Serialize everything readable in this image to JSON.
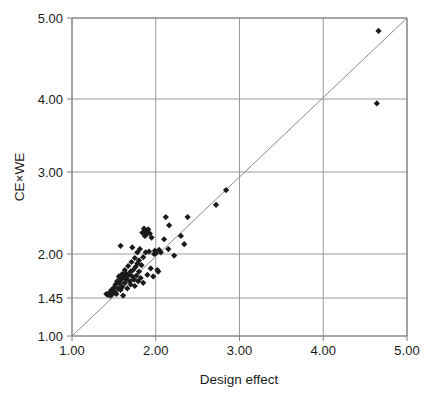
{
  "chart_data": {
    "type": "scatter",
    "title": "",
    "subtitle": "",
    "xlabel": "Design effect",
    "ylabel": "CE×WE",
    "xlim": [
      1.0,
      5.0
    ],
    "ylim": [
      1.0,
      5.0
    ],
    "x_ticks": [
      1.0,
      2.0,
      3.0,
      4.0,
      5.0
    ],
    "x_tick_labels": [
      "1.00",
      "2.00",
      "3.00",
      "4.00",
      "5.00"
    ],
    "y_ticks": [
      1.0,
      1.45,
      2.0,
      3.0,
      4.0,
      5.0
    ],
    "y_tick_labels": [
      "1.00",
      "1.45",
      "2.00",
      "3.00",
      "4.00",
      "5.00"
    ],
    "y_axis_scale": "non-uniform tick spacing (1.00, 1.45, 2.00 compressed; 2.00-5.00 linear)",
    "grid": "horizontal and vertical gridlines at each labelled tick",
    "legend": "none",
    "legend_position": "none",
    "marker": "filled black diamond",
    "marker_size_px": 5,
    "series": [
      {
        "name": "studies",
        "marker_color": "#1a1a1a",
        "points": [
          [
            1.41,
            1.5
          ],
          [
            1.43,
            1.49
          ],
          [
            1.45,
            1.52
          ],
          [
            1.46,
            1.48
          ],
          [
            1.47,
            1.55
          ],
          [
            1.48,
            1.5
          ],
          [
            1.5,
            1.58
          ],
          [
            1.51,
            1.53
          ],
          [
            1.52,
            1.62
          ],
          [
            1.53,
            1.5
          ],
          [
            1.54,
            1.66
          ],
          [
            1.55,
            1.57
          ],
          [
            1.56,
            1.72
          ],
          [
            1.57,
            1.63
          ],
          [
            1.58,
            2.1
          ],
          [
            1.58,
            1.55
          ],
          [
            1.59,
            1.68
          ],
          [
            1.6,
            1.75
          ],
          [
            1.6,
            1.59
          ],
          [
            1.61,
            1.48
          ],
          [
            1.62,
            1.71
          ],
          [
            1.63,
            1.8
          ],
          [
            1.63,
            1.64
          ],
          [
            1.64,
            1.76
          ],
          [
            1.65,
            1.69
          ],
          [
            1.66,
            1.73
          ],
          [
            1.66,
            1.57
          ],
          [
            1.67,
            1.85
          ],
          [
            1.68,
            1.74
          ],
          [
            1.69,
            1.66
          ],
          [
            1.7,
            1.78
          ],
          [
            1.7,
            1.62
          ],
          [
            1.71,
            1.9
          ],
          [
            1.72,
            1.72
          ],
          [
            1.72,
            2.08
          ],
          [
            1.73,
            1.8
          ],
          [
            1.74,
            1.68
          ],
          [
            1.75,
            1.95
          ],
          [
            1.75,
            1.6
          ],
          [
            1.76,
            1.84
          ],
          [
            1.77,
            1.73
          ],
          [
            1.78,
            2.02
          ],
          [
            1.78,
            1.88
          ],
          [
            1.79,
            1.66
          ],
          [
            1.8,
            1.92
          ],
          [
            1.8,
            1.78
          ],
          [
            1.81,
            2.06
          ],
          [
            1.82,
            1.7
          ],
          [
            1.83,
            1.86
          ],
          [
            1.84,
            2.26
          ],
          [
            1.85,
            1.96
          ],
          [
            1.85,
            1.64
          ],
          [
            1.86,
            2.31
          ],
          [
            1.87,
            2.22
          ],
          [
            1.88,
            2.28
          ],
          [
            1.88,
            2.02
          ],
          [
            1.89,
            2.24
          ],
          [
            1.9,
            2.26
          ],
          [
            1.9,
            1.74
          ],
          [
            1.91,
            2.3
          ],
          [
            1.92,
            2.03
          ],
          [
            1.93,
            2.25
          ],
          [
            1.94,
            1.82
          ],
          [
            1.95,
            2.2
          ],
          [
            1.97,
            1.72
          ],
          [
            1.98,
            2.0
          ],
          [
            1.99,
            2.04
          ],
          [
            2.0,
            2.01
          ],
          [
            2.02,
            1.8
          ],
          [
            2.03,
            1.78
          ],
          [
            2.04,
            2.05
          ],
          [
            2.06,
            2.02
          ],
          [
            2.1,
            2.18
          ],
          [
            2.12,
            2.45
          ],
          [
            2.15,
            2.06
          ],
          [
            2.16,
            2.35
          ],
          [
            2.22,
            1.98
          ],
          [
            2.3,
            2.22
          ],
          [
            2.34,
            2.12
          ],
          [
            2.38,
            2.45
          ],
          [
            2.72,
            2.6
          ],
          [
            2.84,
            2.78
          ],
          [
            4.64,
            3.94
          ],
          [
            4.66,
            4.84
          ]
        ]
      }
    ],
    "reference_line": {
      "label": "identity line y = x",
      "from": [
        1.0,
        1.0
      ],
      "to": [
        5.0,
        5.0
      ],
      "color": "#8a8a8a"
    }
  },
  "colors": {
    "background": "#ffffff",
    "axis": "#808080",
    "grid": "#9a9a9a",
    "marker": "#1a1a1a",
    "text": "#1a1a1a"
  }
}
